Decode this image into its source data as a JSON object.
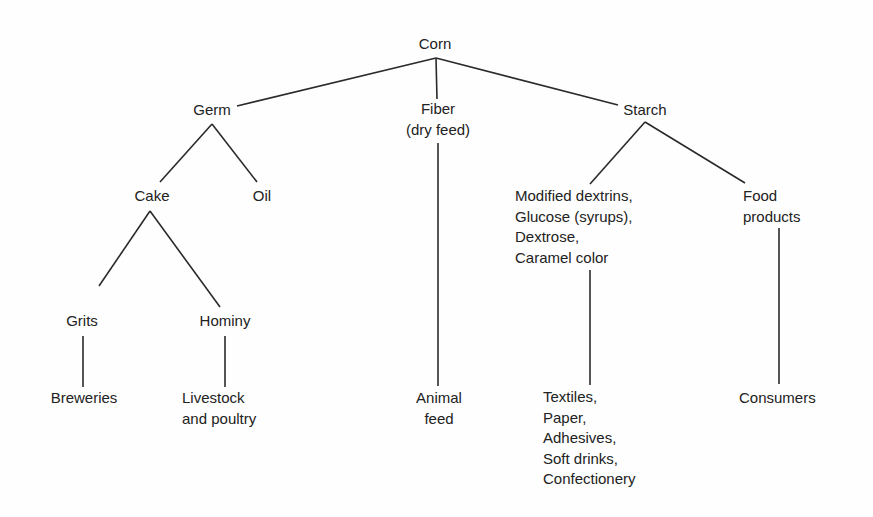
{
  "diagram": {
    "type": "tree",
    "title": "",
    "nodes": {
      "corn": {
        "lines": [
          "Corn"
        ]
      },
      "germ": {
        "lines": [
          "Germ"
        ]
      },
      "fiber": {
        "lines": [
          "Fiber",
          "(dry feed)"
        ]
      },
      "starch": {
        "lines": [
          "Starch"
        ]
      },
      "cake": {
        "lines": [
          "Cake"
        ]
      },
      "oil": {
        "lines": [
          "Oil"
        ]
      },
      "grits": {
        "lines": [
          "Grits"
        ]
      },
      "hominy": {
        "lines": [
          "Hominy"
        ]
      },
      "breweries": {
        "lines": [
          "Breweries"
        ]
      },
      "livestock": {
        "lines": [
          "Livestock",
          "and poultry"
        ]
      },
      "animal_feed": {
        "lines": [
          "Animal",
          "feed"
        ]
      },
      "starch_derivatives": {
        "lines": [
          "Modified dextrins,",
          "Glucose (syrups),",
          "Dextrose,",
          "Caramel color"
        ]
      },
      "food_products": {
        "lines": [
          "Food",
          "products"
        ]
      },
      "industrial_uses": {
        "lines": [
          "Textiles,",
          "Paper,",
          "Adhesives,",
          "Soft drinks,",
          "Confectionery"
        ]
      },
      "consumers": {
        "lines": [
          "Consumers"
        ]
      }
    },
    "edges": [
      [
        "corn",
        "germ"
      ],
      [
        "corn",
        "fiber"
      ],
      [
        "corn",
        "starch"
      ],
      [
        "germ",
        "cake"
      ],
      [
        "germ",
        "oil"
      ],
      [
        "cake",
        "grits"
      ],
      [
        "cake",
        "hominy"
      ],
      [
        "grits",
        "breweries"
      ],
      [
        "hominy",
        "livestock"
      ],
      [
        "fiber",
        "animal_feed"
      ],
      [
        "starch",
        "starch_derivatives"
      ],
      [
        "starch",
        "food_products"
      ],
      [
        "starch_derivatives",
        "industrial_uses"
      ],
      [
        "food_products",
        "consumers"
      ]
    ]
  }
}
